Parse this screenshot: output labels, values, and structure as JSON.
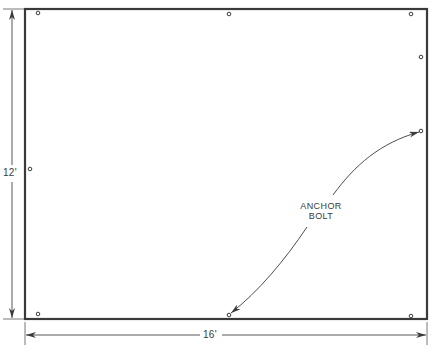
{
  "diagram": {
    "type": "plan view",
    "outline": {
      "x": 25,
      "y": 9,
      "width": 402,
      "height": 310
    },
    "dimensions": {
      "height": {
        "label": "12'"
      },
      "width": {
        "label": "16'"
      }
    },
    "callout": {
      "line1": "ANCHOR",
      "line2": "BOLT"
    },
    "anchor_bolts": [
      {
        "x": 38,
        "y": 13
      },
      {
        "x": 229,
        "y": 14
      },
      {
        "x": 411,
        "y": 14
      },
      {
        "x": 421,
        "y": 57
      },
      {
        "x": 421,
        "y": 131
      },
      {
        "x": 30,
        "y": 169
      },
      {
        "x": 38,
        "y": 314
      },
      {
        "x": 229,
        "y": 315
      },
      {
        "x": 411,
        "y": 316
      }
    ],
    "colors": {
      "line": "#3a3a3a",
      "background": "#ffffff"
    }
  }
}
